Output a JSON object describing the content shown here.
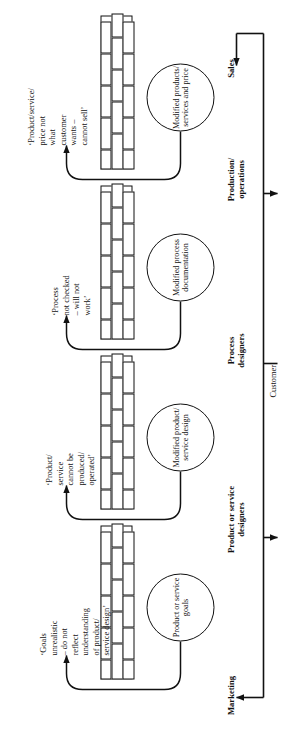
{
  "diagram": {
    "spine_label": "Customer",
    "stages": [
      {
        "id": "marketing",
        "name": "Marketing",
        "circle_label": "Product or\nservice\ngoals",
        "issue_text": "‘Goals\nunrealistic\n– do not\nreflect\nunderstanding\nof product/\nservice design’"
      },
      {
        "id": "product-service-designers",
        "name": "Product or service\ndesigners",
        "circle_label": "Modified\nproduct/\nservice design",
        "issue_text": "‘Product/\nservice\ncannot be\nproduced/\noperated’"
      },
      {
        "id": "process-designers",
        "name": "Process\ndesigners",
        "circle_label": "Modified\nprocess\ndocumentation",
        "issue_text": "‘Process\nnot checked\n– will not\nwork’"
      },
      {
        "id": "production-operations",
        "name": "Production/\noperations",
        "circle_label": "Modified\nproducts/\nservices and\nprice",
        "issue_text": "‘Product/service/\nprice not\nwhat\ncustomer\nwants –\ncannot sell’"
      },
      {
        "id": "sales",
        "name": "Sales"
      }
    ],
    "colors": {
      "ink": "#111111",
      "paper": "#ffffff"
    }
  }
}
